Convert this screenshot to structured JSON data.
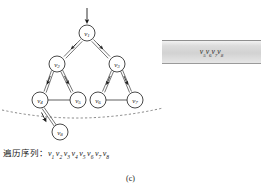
{
  "figure": {
    "caption": "(c)",
    "kind": "graph-traversal-diagram"
  },
  "graph": {
    "nodes": [
      {
        "id": "v1",
        "base": "v",
        "sub": "1",
        "cx": 87,
        "cy": 33,
        "r": 8
      },
      {
        "id": "v2",
        "base": "v",
        "sub": "2",
        "cx": 57,
        "cy": 64,
        "r": 8
      },
      {
        "id": "v3",
        "base": "v",
        "sub": "3",
        "cx": 117,
        "cy": 64,
        "r": 8
      },
      {
        "id": "v4",
        "base": "v",
        "sub": "4",
        "cx": 40,
        "cy": 100,
        "r": 8
      },
      {
        "id": "v5",
        "base": "v",
        "sub": "5",
        "cx": 78,
        "cy": 100,
        "r": 8
      },
      {
        "id": "v6",
        "base": "v",
        "sub": "6",
        "cx": 98,
        "cy": 100,
        "r": 8
      },
      {
        "id": "v7",
        "base": "v",
        "sub": "7",
        "cx": 135,
        "cy": 100,
        "r": 8
      },
      {
        "id": "v8",
        "base": "v",
        "sub": "8",
        "cx": 60,
        "cy": 132,
        "r": 8
      }
    ],
    "directed_edges": [
      {
        "from": "v1",
        "to": "v2"
      },
      {
        "from": "v1",
        "to": "v3"
      },
      {
        "from": "v2",
        "to": "v4"
      },
      {
        "from": "v2",
        "to": "v5"
      },
      {
        "from": "v3",
        "to": "v6"
      },
      {
        "from": "v3",
        "to": "v7"
      },
      {
        "from": "v4",
        "to": "v8"
      }
    ],
    "plain_edges": [
      {
        "from": "v4",
        "to": "v5"
      },
      {
        "from": "v6",
        "to": "v7"
      }
    ],
    "entry_arrow": {
      "label": "entry-arrow",
      "to": "v1"
    },
    "frontier_curve": {
      "label": "dashed-frontier-curve"
    }
  },
  "queue": {
    "name": "queue-box",
    "items": [
      "v5",
      "v6",
      "v7",
      "v8"
    ],
    "text": "v5v6v7v8",
    "fill_color": "#d8d8d8",
    "border_color": "#8f8f8f"
  },
  "sequence": {
    "label": "遍历序列：",
    "items": [
      {
        "base": "v",
        "sub": "1"
      },
      {
        "base": "v",
        "sub": "2"
      },
      {
        "base": "v",
        "sub": "3"
      },
      {
        "base": "v",
        "sub": "4"
      },
      {
        "base": "v",
        "sub": "5"
      },
      {
        "base": "v",
        "sub": "6"
      },
      {
        "base": "v",
        "sub": "7"
      },
      {
        "base": "v",
        "sub": "8"
      }
    ]
  },
  "colors": {
    "ink": "#1a1a1a",
    "background": "#ffffff",
    "dashed": "#555555"
  }
}
